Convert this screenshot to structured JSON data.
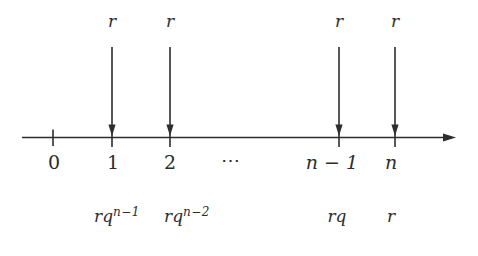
{
  "colors": {
    "background": "#ffffff",
    "ink": "#2d2d2d"
  },
  "payments": [
    {
      "amount": "r"
    },
    {
      "amount": "r"
    },
    {
      "amount": "r"
    },
    {
      "amount": "r"
    }
  ],
  "axis": {
    "ticks": [
      "0",
      "1",
      "2",
      "⋯",
      "n − 1",
      "n"
    ]
  },
  "present_values": [
    {
      "base": "rq",
      "sup": "n−1"
    },
    {
      "base": "rq",
      "sup": "n−2"
    },
    {
      "base": "rq",
      "sup": ""
    },
    {
      "base": "r",
      "sup": ""
    }
  ]
}
